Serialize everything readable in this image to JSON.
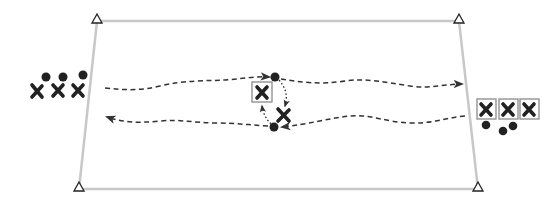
{
  "diagram": {
    "type": "drill-diagram",
    "colors": {
      "field_line": "#c8c8c8",
      "ink": "#222222",
      "box_outline": "#8a8a8a",
      "background": "#ffffff"
    },
    "field": {
      "shape": "trapezoid",
      "corners": [
        [
          97,
          21
        ],
        [
          459,
          21
        ],
        [
          478,
          189
        ],
        [
          79,
          189
        ]
      ]
    },
    "cones": [
      {
        "id": "cone-top-left",
        "x": 97,
        "y": 19
      },
      {
        "id": "cone-top-right",
        "x": 459,
        "y": 19
      },
      {
        "id": "cone-bottom-left",
        "x": 79,
        "y": 187
      },
      {
        "id": "cone-bottom-right",
        "x": 478,
        "y": 187
      }
    ],
    "groups": {
      "left": {
        "players": [
          {
            "x": 37,
            "y": 91,
            "boxed": false
          },
          {
            "x": 58,
            "y": 90,
            "boxed": false
          },
          {
            "x": 78,
            "y": 90,
            "boxed": false
          }
        ],
        "balls": [
          {
            "x": 46,
            "y": 77
          },
          {
            "x": 63,
            "y": 77
          },
          {
            "x": 83,
            "y": 75
          }
        ]
      },
      "center": {
        "players": [
          {
            "x": 262,
            "y": 92,
            "boxed": true
          },
          {
            "x": 284,
            "y": 115,
            "boxed": false
          }
        ],
        "balls": [
          {
            "x": 275,
            "y": 77
          },
          {
            "x": 274,
            "y": 127
          }
        ]
      },
      "right": {
        "players": [
          {
            "x": 486,
            "y": 109,
            "boxed": true
          },
          {
            "x": 508,
            "y": 109,
            "boxed": true
          },
          {
            "x": 530,
            "y": 109,
            "boxed": true
          }
        ],
        "balls": [
          {
            "x": 486,
            "y": 125
          },
          {
            "x": 503,
            "y": 132
          },
          {
            "x": 513,
            "y": 126
          }
        ]
      }
    },
    "paths": [
      {
        "id": "run-top-left",
        "style": "dashed",
        "direction": "left-to-center"
      },
      {
        "id": "run-top-right",
        "style": "dashed",
        "direction": "center-to-right"
      },
      {
        "id": "run-bottom-right",
        "style": "dashed",
        "direction": "right-to-center"
      },
      {
        "id": "run-bottom-left",
        "style": "dashed",
        "direction": "center-to-left"
      },
      {
        "id": "pass-top-to-x",
        "style": "dotted",
        "direction": "ball-to-player"
      },
      {
        "id": "pass-bottom-to-box",
        "style": "dotted",
        "direction": "ball-to-boxed-player"
      }
    ]
  }
}
